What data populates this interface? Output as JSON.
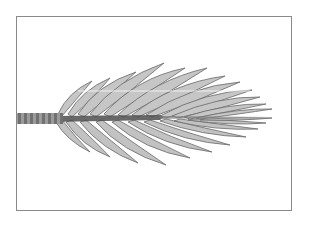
{
  "image": {
    "subject": "palm frond",
    "alt": "Grayscale illustration of a pinnate palm frond with a striped petiole, inside a thin gray rectangular frame",
    "colors": {
      "background": "#ffffff",
      "frame": "#8a8a8a",
      "leaflet_fill": "#c4c4c4",
      "leaflet_edge": "#6a6a6a",
      "rachis": "#4a4a4a",
      "petiole_light": "#9a9a9a",
      "petiole_dark": "#5a5a5a",
      "highlight_line": "#f2f2f2"
    }
  }
}
